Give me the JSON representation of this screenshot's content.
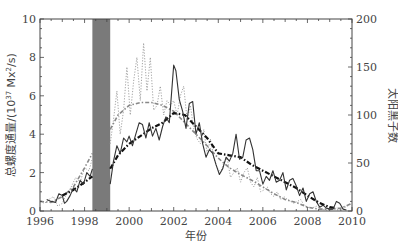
{
  "chart_data": {
    "type": "line",
    "title": "",
    "xlabel": "年份",
    "ylabel": "总螺度通量/(10^37 Mx^2/s)",
    "ylabel_parts": {
      "main": "总螺度通量/(10",
      "exp1": "37",
      "mid": " Mx",
      "exp2": "2",
      "tail": "/s)"
    },
    "y2label": "太阳黑子数",
    "xlim": [
      1996,
      2010
    ],
    "ylim": [
      0,
      10
    ],
    "y2lim": [
      0,
      200
    ],
    "xticks": [
      1996,
      1998,
      2000,
      2002,
      2004,
      2006,
      2008,
      2010
    ],
    "yticks": [
      0,
      2,
      4,
      6,
      8,
      10
    ],
    "y2ticks": [
      0,
      50,
      100,
      150,
      200
    ],
    "grid": false,
    "legend": null,
    "shaded_region": {
      "x_start": 1998.35,
      "x_end": 1999.15,
      "color": "#7a7a7a",
      "label": "data gap"
    },
    "series": [
      {
        "name": "总螺度通量 (monthly)",
        "axis": "left",
        "style": "solid",
        "color": "#333333",
        "x": [
          1996.3,
          1996.5,
          1996.7,
          1996.85,
          1997.0,
          1997.1,
          1997.2,
          1997.35,
          1997.5,
          1997.65,
          1997.8,
          1997.95,
          1998.1,
          1998.25,
          1998.35,
          1999.15,
          1999.3,
          1999.45,
          1999.6,
          1999.75,
          1999.9,
          2000.0,
          2000.15,
          2000.3,
          2000.45,
          2000.6,
          2000.75,
          2000.9,
          2001.05,
          2001.2,
          2001.35,
          2001.5,
          2001.65,
          2001.8,
          1901.9,
          2002.0,
          2002.1,
          2002.25,
          2002.4,
          2002.55,
          2002.7,
          2002.85,
          2003.0,
          2003.15,
          2003.3,
          2003.45,
          2003.6,
          2003.75,
          2003.9,
          2004.05,
          2004.2,
          2004.35,
          2004.5,
          2004.65,
          2004.8,
          2004.95,
          2005.1,
          2005.25,
          2005.4,
          2005.55,
          2005.7,
          2005.85,
          2006.0,
          2006.15,
          2006.3,
          2006.45,
          2006.6,
          2006.75,
          2006.9,
          2007.05,
          2007.2,
          2007.35,
          2007.5,
          2007.65,
          2007.8,
          2007.95,
          2008.1,
          2008.25,
          2008.4,
          2008.55,
          2008.7,
          2008.85,
          2009.0,
          2009.15,
          2009.3,
          2009.45,
          2009.6,
          2009.75
        ],
        "values": [
          0.6,
          0.5,
          0.45,
          0.9,
          0.8,
          0.4,
          0.5,
          0.8,
          1.2,
          1.0,
          1.6,
          1.4,
          2.0,
          1.8,
          2.2,
          1.4,
          2.6,
          3.4,
          3.0,
          3.8,
          3.6,
          3.9,
          3.4,
          4.0,
          4.6,
          4.5,
          3.8,
          4.6,
          3.9,
          4.3,
          3.7,
          4.4,
          4.9,
          4.6,
          4.6,
          7.6,
          7.3,
          5.8,
          5.2,
          4.3,
          5.6,
          5.7,
          4.0,
          4.6,
          3.5,
          2.8,
          3.2,
          3.0,
          2.4,
          1.9,
          2.2,
          2.8,
          2.6,
          3.0,
          4.0,
          2.7,
          2.8,
          3.7,
          3.8,
          3.2,
          2.1,
          2.1,
          1.4,
          1.8,
          1.6,
          2.1,
          1.5,
          1.6,
          2.0,
          1.1,
          1.6,
          1.7,
          1.3,
          0.8,
          1.2,
          0.5,
          0.9,
          1.0,
          0.5,
          0.2,
          0.3,
          0.15,
          0.1,
          0.1,
          0.5,
          0.4,
          0.1,
          0.05
        ]
      },
      {
        "name": "太阳黑子数 (monthly)",
        "axis": "right",
        "style": "dotted",
        "color": "#999999",
        "x": [
          1996.0,
          1996.2,
          1996.4,
          1996.6,
          1996.8,
          1997.0,
          1997.2,
          1997.4,
          1997.6,
          1997.8,
          1998.0,
          1998.2,
          1998.35,
          1999.15,
          1999.3,
          1999.45,
          1999.6,
          1999.75,
          1999.9,
          2000.05,
          2000.2,
          2000.35,
          2000.5,
          2000.65,
          2000.8,
          2000.95,
          2001.1,
          2001.25,
          2001.4,
          2001.55,
          2001.7,
          2001.85,
          2002.0,
          2002.15,
          2002.3,
          2002.45,
          2002.6,
          2002.75,
          2002.9,
          2003.05,
          2003.2,
          2003.35,
          2003.5,
          2003.65,
          2003.8,
          2003.95,
          2004.1,
          2004.25,
          2004.4,
          2004.55,
          2004.7,
          2004.85,
          2005.0,
          2005.15,
          2005.3,
          2005.45,
          2005.6,
          2005.75,
          2005.9,
          2006.05,
          2006.2,
          2006.35,
          2006.5,
          2006.65,
          2006.8,
          2006.95,
          2007.1,
          2007.25,
          2007.4,
          2007.55,
          2007.7,
          2007.85,
          2008.0,
          2008.2,
          2008.4,
          2008.6,
          2008.8,
          2009.0,
          2009.2,
          2009.4,
          2009.6,
          2009.8,
          2010.0
        ],
        "values": [
          10,
          8,
          12,
          15,
          5,
          8,
          18,
          25,
          35,
          30,
          45,
          42,
          55,
          70,
          95,
          125,
          80,
          105,
          150,
          100,
          135,
          160,
          115,
          175,
          125,
          160,
          105,
          110,
          130,
          100,
          115,
          110,
          115,
          100,
          120,
          130,
          95,
          110,
          85,
          75,
          70,
          85,
          60,
          75,
          55,
          45,
          40,
          50,
          55,
          35,
          40,
          45,
          30,
          40,
          45,
          30,
          25,
          35,
          20,
          22,
          25,
          18,
          15,
          20,
          12,
          15,
          12,
          10,
          8,
          10,
          12,
          6,
          4,
          3,
          5,
          2,
          1,
          1,
          2,
          1,
          3,
          5,
          8
        ],
        "note": "thin gray dotted line, approximate"
      },
      {
        "name": "总螺度通量 (smoothed)",
        "axis": "left",
        "style": "dash-dot thick",
        "color": "#111111",
        "x": [
          1997.0,
          1997.5,
          1998.0,
          1998.35,
          1999.15,
          1999.5,
          2000.0,
          2000.5,
          2001.0,
          2001.5,
          2002.0,
          2002.5,
          2003.0,
          2003.5,
          2004.0,
          2004.5,
          2005.0,
          2005.5,
          2006.0,
          2006.5,
          2007.0,
          2007.5,
          2008.0,
          2008.5,
          2009.0,
          2009.3
        ],
        "values": [
          0.8,
          1.1,
          1.5,
          1.8,
          2.2,
          2.9,
          3.5,
          3.9,
          4.3,
          4.6,
          5.1,
          5.0,
          4.4,
          3.8,
          3.0,
          2.9,
          2.8,
          2.4,
          2.1,
          1.8,
          1.5,
          1.2,
          0.8,
          0.45,
          0.2,
          0.15
        ]
      },
      {
        "name": "太阳黑子数 (smoothed)",
        "axis": "right",
        "style": "dash-dot thin",
        "color": "#888888",
        "x": [
          1996.0,
          1996.5,
          1997.0,
          1997.5,
          1998.0,
          1998.35,
          1999.15,
          1999.5,
          2000.0,
          2000.5,
          2001.0,
          2001.5,
          2002.0,
          2002.5,
          2003.0,
          2003.5,
          2004.0,
          2004.5,
          2005.0,
          2005.5,
          2006.0,
          2006.5,
          2007.0,
          2007.5,
          2008.0,
          2008.5,
          2009.0,
          2009.5,
          2010.0
        ],
        "values": [
          10,
          9,
          15,
          25,
          45,
          60,
          85,
          100,
          110,
          113,
          113,
          110,
          104,
          92,
          80,
          68,
          55,
          45,
          38,
          32,
          25,
          18,
          12,
          9,
          4,
          2,
          2,
          3,
          8
        ]
      }
    ]
  }
}
